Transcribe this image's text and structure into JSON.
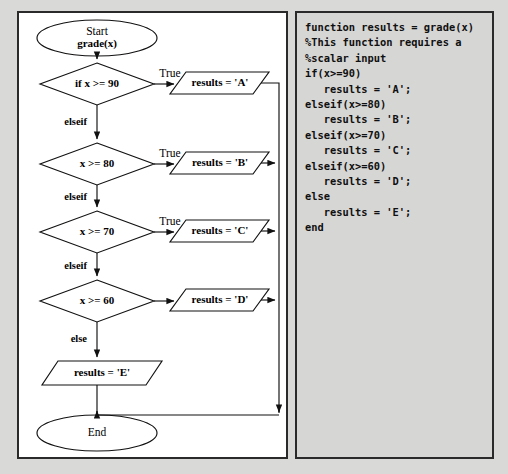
{
  "figure": {
    "background_color": "#d9d9d7",
    "panel_border_color": "#2a2a2a",
    "flow_panel_background": "#ffffff",
    "code_panel_background": "#d6d6d4"
  },
  "flowchart": {
    "start": {
      "line1": "Start",
      "line2": "grade(x)"
    },
    "end": {
      "label": "End"
    },
    "decisions": [
      {
        "label": "if  x >= 90",
        "true_label": "True",
        "false_label": "elseif"
      },
      {
        "label": "x >= 80",
        "true_label": "True",
        "false_label": "elseif"
      },
      {
        "label": "x >= 70",
        "true_label": "True",
        "false_label": "elseif"
      },
      {
        "label": "x >= 60",
        "true_label": "",
        "false_label": "else"
      }
    ],
    "processes": [
      {
        "label": "results = 'A'"
      },
      {
        "label": "results = 'B'"
      },
      {
        "label": "results = 'C'"
      },
      {
        "label": "results = 'D'"
      },
      {
        "label": "results = 'E'"
      }
    ]
  },
  "code": {
    "language": "MATLAB",
    "lines": [
      "function results = grade(x)",
      "%This function requires a",
      "%scalar input",
      "if(x>=90)",
      "   results = 'A';",
      "elseif(x>=80)",
      "   results = 'B';",
      "elseif(x>=70)",
      "   results = 'C';",
      "elseif(x>=60)",
      "   results = 'D';",
      "else",
      "   results = 'E';",
      "end"
    ],
    "text": "function results = grade(x)\n%This function requires a\n%scalar input\nif(x>=90)\n   results = 'A';\nelseif(x>=80)\n   results = 'B';\nelseif(x>=70)\n   results = 'C';\nelseif(x>=60)\n   results = 'D';\nelse\n   results = 'E';\nend"
  }
}
